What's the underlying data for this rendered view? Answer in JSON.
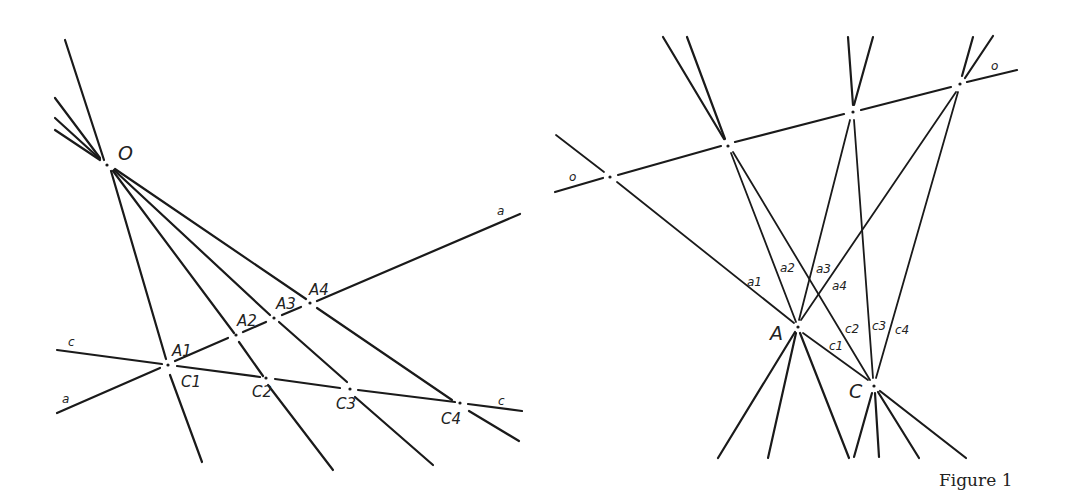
{
  "caption": "Figure 1",
  "left_figure": {
    "center_label": "O",
    "line_labels": {
      "a_start": "a",
      "a_end": "a",
      "c_start": "c",
      "c_end": "c"
    },
    "points_a": [
      "A1",
      "A2",
      "A3",
      "A4"
    ],
    "points_c": [
      "C1",
      "C2",
      "C3",
      "C4"
    ]
  },
  "right_figure": {
    "line_labels": {
      "o_start": "o",
      "o_end": "o"
    },
    "point_A": "A",
    "point_C": "C",
    "rays_a": [
      "a1",
      "a2",
      "a3",
      "a4"
    ],
    "rays_c": [
      "c1",
      "c2",
      "c3",
      "c4"
    ]
  },
  "colors": {
    "ink": "#1a1a1a",
    "background": "#ffffff"
  }
}
